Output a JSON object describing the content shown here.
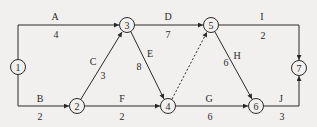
{
  "diagram": {
    "type": "activity-on-arrow network",
    "nodes": [
      {
        "id": "1",
        "label": "1",
        "x": 18,
        "y": 67
      },
      {
        "id": "2",
        "label": "2",
        "x": 77,
        "y": 106
      },
      {
        "id": "3",
        "label": "3",
        "x": 127,
        "y": 25
      },
      {
        "id": "4",
        "label": "4",
        "x": 168,
        "y": 106
      },
      {
        "id": "5",
        "label": "5",
        "x": 211,
        "y": 25
      },
      {
        "id": "6",
        "label": "6",
        "x": 256,
        "y": 106
      },
      {
        "id": "7",
        "label": "7",
        "x": 299,
        "y": 68
      }
    ],
    "edges": [
      {
        "activity": "A",
        "duration": "4",
        "from": "1",
        "to": "3"
      },
      {
        "activity": "B",
        "duration": "2",
        "from": "1",
        "to": "2"
      },
      {
        "activity": "C",
        "duration": "3",
        "from": "2",
        "to": "3"
      },
      {
        "activity": "D",
        "duration": "7",
        "from": "3",
        "to": "5"
      },
      {
        "activity": "E",
        "duration": "8",
        "from": "3",
        "to": "4"
      },
      {
        "activity": "F",
        "duration": "2",
        "from": "2",
        "to": "4"
      },
      {
        "activity": "G",
        "duration": "6",
        "from": "4",
        "to": "6"
      },
      {
        "activity": "H",
        "duration": "6",
        "from": "5",
        "to": "6"
      },
      {
        "activity": "I",
        "duration": "2",
        "from": "5",
        "to": "7"
      },
      {
        "activity": "J",
        "duration": "3",
        "from": "6",
        "to": "7"
      },
      {
        "activity": "",
        "duration": "",
        "from": "4",
        "to": "5",
        "dummy": true
      }
    ]
  },
  "colors": {
    "stroke": "#2a2a2a",
    "background": "#f1f0ee"
  }
}
